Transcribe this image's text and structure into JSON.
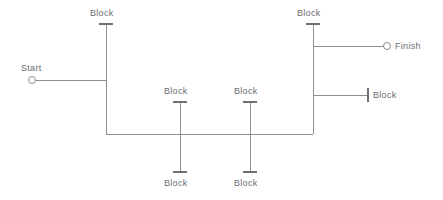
{
  "diagram": {
    "type": "block-schematic",
    "width": 443,
    "height": 200,
    "colors": {
      "background": "#ffffff",
      "wire": "#8d8f92",
      "tick": "#6e7073",
      "text": "#6b6d70"
    },
    "terminals": [
      {
        "id": "start",
        "label": "Start",
        "cx": 32,
        "cy": 80,
        "r": 3.5,
        "label_x": 21,
        "label_y": 63
      },
      {
        "id": "finish",
        "label": "Finish",
        "cx": 387,
        "cy": 46,
        "r": 3.5,
        "label_x": 395,
        "label_y": 41
      }
    ],
    "blocks": [
      {
        "id": "block-top-left",
        "label": "Block",
        "label_x": 90,
        "label_y": 8,
        "tick_x1": 99,
        "tick_x2": 113,
        "tick_y": 24
      },
      {
        "id": "block-top-right",
        "label": "Block",
        "label_x": 297,
        "label_y": 8,
        "tick_x1": 306,
        "tick_x2": 320,
        "tick_y": 24
      },
      {
        "id": "block-mid-left-up",
        "label": "Block",
        "label_x": 164,
        "label_y": 86,
        "tick_x1": 173,
        "tick_x2": 187,
        "tick_y": 102
      },
      {
        "id": "block-mid-right-up",
        "label": "Block",
        "label_x": 234,
        "label_y": 86,
        "tick_x1": 243,
        "tick_x2": 257,
        "tick_y": 102
      },
      {
        "id": "block-mid-left-dn",
        "label": "Block",
        "label_x": 164,
        "label_y": 178,
        "tick_x1": 173,
        "tick_x2": 187,
        "tick_y": 172
      },
      {
        "id": "block-mid-right-dn",
        "label": "Block",
        "label_x": 234,
        "label_y": 178,
        "tick_x1": 243,
        "tick_x2": 257,
        "tick_y": 172
      },
      {
        "id": "block-right-side",
        "label": "Block",
        "label_x": 373,
        "label_y": 90,
        "tick_y1": 88,
        "tick_y2": 102,
        "tick_x": 368
      }
    ],
    "wires": {
      "start_lead": "M 36 80 L 106 80",
      "left_vertical": "M 106 24 L 106 134",
      "bottom_bus": "M 106 134 L 313 134",
      "right_vertical": "M 313 24 L 313 134",
      "mid_left_vertical": "M 180 102 L 180 172",
      "mid_right_vertical": "M 250 102 L 250 172",
      "finish_lead": "M 313 46 L 383 46",
      "right_block_lead": "M 313 95 L 368 95"
    }
  }
}
